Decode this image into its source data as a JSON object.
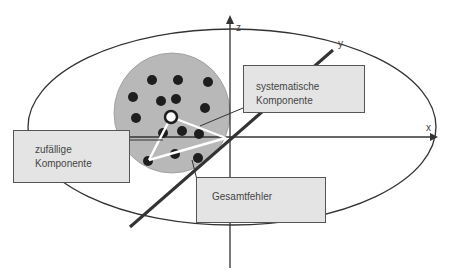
{
  "axes": {
    "x_label": "x",
    "y_label": "y",
    "z_label": "z"
  },
  "labels": {
    "systematic": {
      "line1": "systematische",
      "line2": "Komponente"
    },
    "random": {
      "line1": "zufällige",
      "line2": "Komponente"
    },
    "total": {
      "line1": "Gesamtfehler"
    }
  },
  "colors": {
    "background": "#ffffff",
    "target_disc": "#b8b8b8",
    "dots": "#1e1e1e",
    "box_fill": "#e4e4e4",
    "lines": "#333333",
    "vectors": "#ffffff"
  }
}
